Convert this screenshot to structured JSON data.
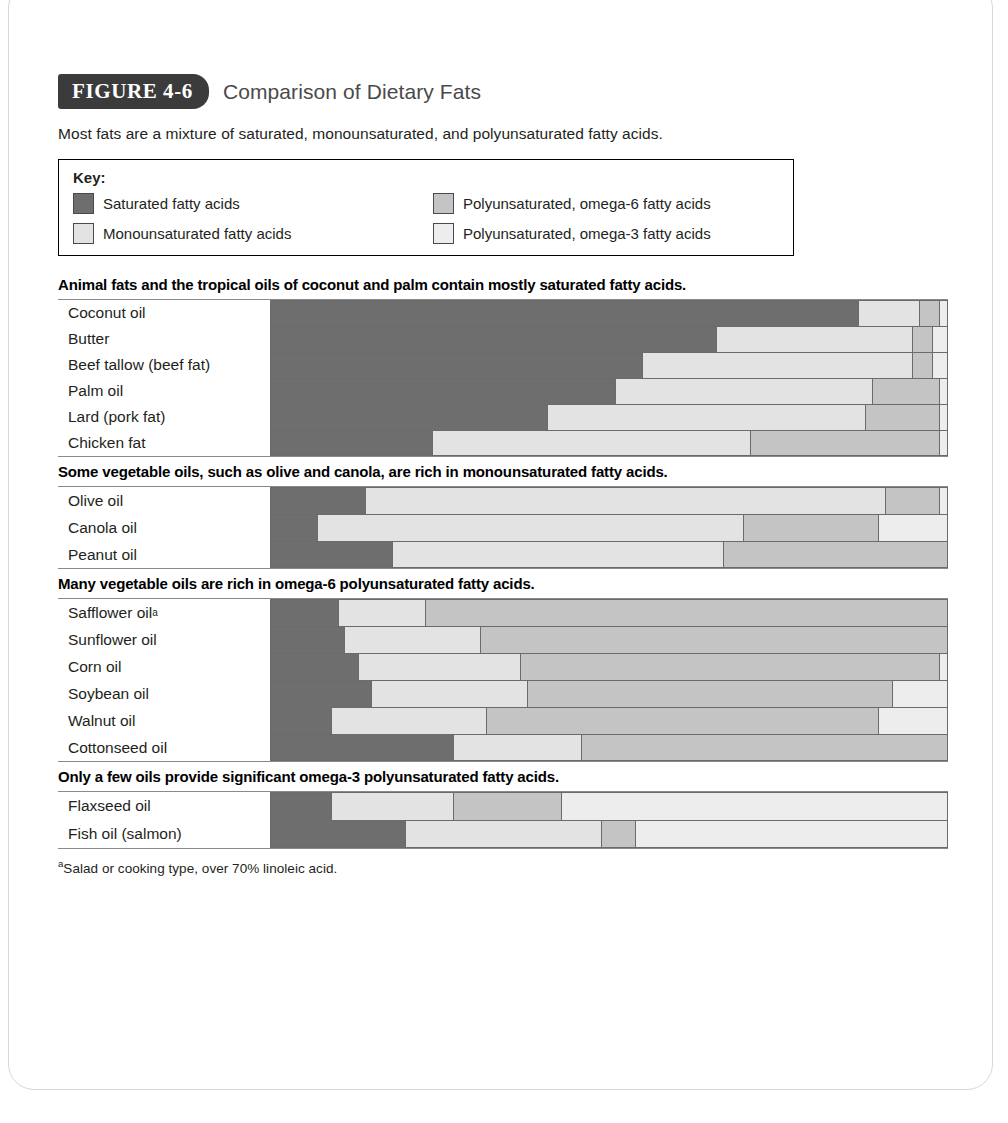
{
  "figure": {
    "tag": "FIGURE 4-6",
    "title": "Comparison of Dietary Fats",
    "subtitle": "Most fats are a mixture of saturated, monounsaturated, and polyunsaturated fatty acids.",
    "footnote_marker": "a",
    "footnote": "Salad or cooking type, over 70% linoleic acid."
  },
  "key": {
    "title": "Key:",
    "items": [
      {
        "label": "Saturated fatty acids",
        "color": "#6e6e6e"
      },
      {
        "label": "Polyunsaturated, omega-6 fatty acids",
        "color": "#c4c4c4"
      },
      {
        "label": "Monounsaturated fatty acids",
        "color": "#e3e3e3"
      },
      {
        "label": "Polyunsaturated, omega-3 fatty acids",
        "color": "#ededed"
      }
    ]
  },
  "colors": {
    "saturated": "#6e6e6e",
    "monounsaturated": "#e3e3e3",
    "omega6": "#c4c4c4",
    "omega3": "#ededed",
    "tag_bg": "#3b3b3b",
    "title_text": "#4a4a4a",
    "bar_border": "#6b6b6b"
  },
  "chart_data": {
    "type": "bar",
    "subtype": "100% stacked horizontal bar",
    "title": "Comparison of Dietary Fats",
    "xlabel": "",
    "ylabel": "",
    "xlim": [
      0,
      100
    ],
    "grid": false,
    "legend_position": "top",
    "series": [
      {
        "name": "Saturated fatty acids",
        "color": "#6e6e6e"
      },
      {
        "name": "Monounsaturated fatty acids",
        "color": "#e3e3e3"
      },
      {
        "name": "Polyunsaturated, omega-6 fatty acids",
        "color": "#c4c4c4"
      },
      {
        "name": "Polyunsaturated, omega-3 fatty acids",
        "color": "#ededed"
      }
    ],
    "groups": [
      {
        "heading": "Animal fats and the tropical oils of coconut and palm contain mostly saturated fatty acids.",
        "rows": [
          {
            "label": "Coconut oil",
            "saturated": 87,
            "monounsaturated": 9,
            "omega6": 3,
            "omega3": 1
          },
          {
            "label": "Butter",
            "saturated": 66,
            "monounsaturated": 29,
            "omega6": 3,
            "omega3": 2
          },
          {
            "label": "Beef tallow (beef fat)",
            "saturated": 55,
            "monounsaturated": 40,
            "omega6": 3,
            "omega3": 2
          },
          {
            "label": "Palm oil",
            "saturated": 51,
            "monounsaturated": 38,
            "omega6": 10,
            "omega3": 1
          },
          {
            "label": "Lard (pork fat)",
            "saturated": 41,
            "monounsaturated": 47,
            "omega6": 11,
            "omega3": 1
          },
          {
            "label": "Chicken fat",
            "saturated": 24,
            "monounsaturated": 47,
            "omega6": 28,
            "omega3": 1
          }
        ]
      },
      {
        "heading": "Some vegetable oils, such as olive and canola, are rich in monounsaturated fatty acids.",
        "rows": [
          {
            "label": "Olive oil",
            "saturated": 14,
            "monounsaturated": 77,
            "omega6": 8,
            "omega3": 1
          },
          {
            "label": "Canola oil",
            "saturated": 7,
            "monounsaturated": 63,
            "omega6": 20,
            "omega3": 10
          },
          {
            "label": "Peanut oil",
            "saturated": 18,
            "monounsaturated": 49,
            "omega6": 33,
            "omega3": 0
          }
        ]
      },
      {
        "heading": "Many vegetable oils are rich in omega-6 polyunsaturated fatty acids.",
        "rows": [
          {
            "label": "Safflower oil",
            "marker": "a",
            "saturated": 10,
            "monounsaturated": 13,
            "omega6": 77,
            "omega3": 0
          },
          {
            "label": "Sunflower oil",
            "saturated": 11,
            "monounsaturated": 20,
            "omega6": 69,
            "omega3": 0
          },
          {
            "label": "Corn oil",
            "saturated": 13,
            "monounsaturated": 24,
            "omega6": 62,
            "omega3": 1
          },
          {
            "label": "Soybean oil",
            "saturated": 15,
            "monounsaturated": 23,
            "omega6": 54,
            "omega3": 8
          },
          {
            "label": "Walnut oil",
            "saturated": 9,
            "monounsaturated": 23,
            "omega6": 58,
            "omega3": 10
          },
          {
            "label": "Cottonseed oil",
            "saturated": 27,
            "monounsaturated": 19,
            "omega6": 54,
            "omega3": 0
          }
        ]
      },
      {
        "heading": "Only a few oils provide significant omega-3 polyunsaturated fatty acids.",
        "rows": [
          {
            "label": "Flaxseed oil",
            "saturated": 9,
            "monounsaturated": 18,
            "omega6": 16,
            "omega3": 57
          },
          {
            "label": "Fish oil (salmon)",
            "saturated": 20,
            "monounsaturated": 29,
            "omega6": 5,
            "omega3": 46
          }
        ]
      }
    ]
  }
}
